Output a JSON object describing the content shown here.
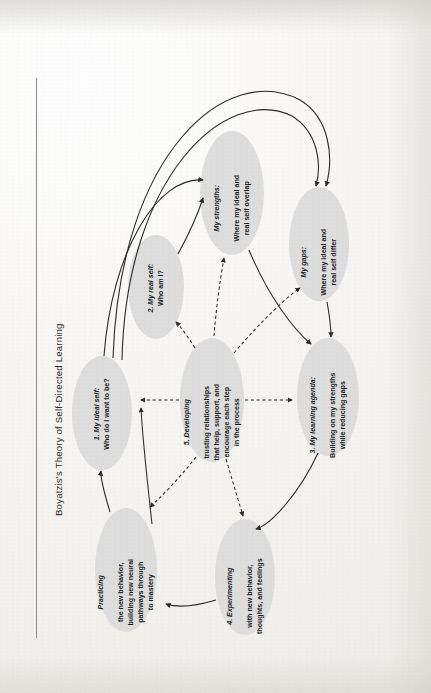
{
  "figure": {
    "title": "Boyatzis's Theory of Self-Directed Learning",
    "orientation": "rotated-90-ccw",
    "page_background": "#f4f3f0",
    "node_fill": "#dedede",
    "line_color": "#2b2b2b"
  },
  "nodes": [
    {
      "id": "ideal-self",
      "lead": "1. My ideal self:",
      "body": "Who do I want to be?"
    },
    {
      "id": "real-self",
      "lead": "2. My real self:",
      "body": "Who am I?"
    },
    {
      "id": "strengths",
      "lead": "My strengths:",
      "body": "Where my ideal and\nreal self overlap"
    },
    {
      "id": "gaps",
      "lead": "My gaps:",
      "body": "Where my ideal and\nreal self differ"
    },
    {
      "id": "learning-agenda",
      "lead": "3. My learning agenda:",
      "body": "Building on my strengths\nwhile reducing gaps"
    },
    {
      "id": "experimenting",
      "lead": "4. Experimenting",
      "body": "with new behavior,\nthoughts, and feelings"
    },
    {
      "id": "practicing",
      "lead": "Practicing",
      "body": "the new behavior,\nbuilding new neural\npathways through\nto mastery"
    },
    {
      "id": "trusting-relationships",
      "lead": "5. Developing",
      "body": "trusting relationships\nthat help, support, and\nencourage each step\nin the process"
    }
  ],
  "connections": [
    {
      "from": "ideal-self",
      "to": "strengths",
      "style": "solid-arrow"
    },
    {
      "from": "ideal-self",
      "to": "gaps",
      "style": "solid-arrow"
    },
    {
      "from": "real-self",
      "to": "strengths",
      "style": "solid-arrow"
    },
    {
      "from": "real-self",
      "to": "gaps",
      "style": "solid-arrow"
    },
    {
      "from": "strengths",
      "to": "learning-agenda",
      "style": "solid-arrow"
    },
    {
      "from": "gaps",
      "to": "learning-agenda",
      "style": "solid-arrow"
    },
    {
      "from": "learning-agenda",
      "to": "experimenting",
      "style": "solid-arrow"
    },
    {
      "from": "experimenting",
      "to": "practicing",
      "style": "solid-arrow"
    },
    {
      "from": "practicing",
      "to": "ideal-self",
      "style": "solid-arrow"
    },
    {
      "from": "trusting-relationships",
      "to": "real-self",
      "style": "dashed-arrow"
    },
    {
      "from": "trusting-relationships",
      "to": "strengths",
      "style": "dashed-arrow"
    },
    {
      "from": "trusting-relationships",
      "to": "gaps",
      "style": "dashed-arrow"
    },
    {
      "from": "trusting-relationships",
      "to": "learning-agenda",
      "style": "dashed-arrow"
    },
    {
      "from": "trusting-relationships",
      "to": "experimenting",
      "style": "dashed-arrow"
    },
    {
      "from": "trusting-relationships",
      "to": "practicing",
      "style": "dashed-arrow"
    }
  ]
}
